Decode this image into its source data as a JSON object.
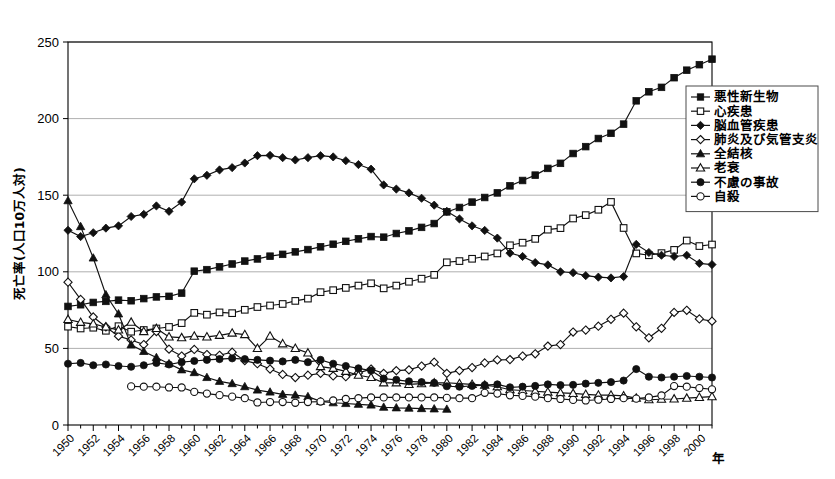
{
  "chart_data": {
    "type": "line",
    "title": "",
    "xlabel": "年",
    "ylabel": "死亡率(人口10万人対)",
    "ylim": [
      0,
      250
    ],
    "yticks": [
      0,
      50,
      100,
      150,
      200,
      250
    ],
    "xlim": [
      1950,
      2001
    ],
    "grid": "horizontal",
    "legend_position": "right-top",
    "x": [
      1950,
      1951,
      1952,
      1953,
      1954,
      1955,
      1956,
      1957,
      1958,
      1959,
      1960,
      1961,
      1962,
      1963,
      1964,
      1965,
      1966,
      1967,
      1968,
      1969,
      1970,
      1971,
      1972,
      1973,
      1974,
      1975,
      1976,
      1977,
      1978,
      1979,
      1980,
      1981,
      1982,
      1983,
      1984,
      1985,
      1986,
      1987,
      1988,
      1989,
      1990,
      1991,
      1992,
      1993,
      1994,
      1995,
      1996,
      1997,
      1998,
      1999,
      2000,
      2001
    ],
    "xtick_labels": [
      "1950",
      "1952",
      "1954",
      "1956",
      "1958",
      "1960",
      "1962",
      "1964",
      "1966",
      "1968",
      "1970",
      "1972",
      "1974",
      "1976",
      "1978",
      "1980",
      "1982",
      "1984",
      "1986",
      "1988",
      "1990",
      "1992",
      "1994",
      "1996",
      "1998",
      "2000"
    ],
    "series": [
      {
        "name": "悪性新生物",
        "marker": "filled-square",
        "values": [
          77.4,
          78.5,
          80.0,
          80.7,
          81.5,
          81.1,
          82.5,
          83.6,
          84.0,
          86.1,
          100.4,
          101.4,
          103.2,
          105.1,
          107.0,
          108.4,
          110.2,
          111.4,
          113.0,
          114.5,
          116.3,
          118.0,
          119.9,
          121.5,
          123.0,
          122.6,
          125.0,
          126.7,
          129.0,
          131.5,
          139.1,
          142.0,
          145.5,
          148.5,
          151.5,
          156.1,
          159.6,
          163.1,
          167.5,
          170.8,
          177.2,
          181.7,
          187.0,
          190.4,
          196.4,
          211.6,
          217.5,
          220.4,
          226.7,
          231.6,
          235.2,
          238.8
        ]
      },
      {
        "name": "心疾患",
        "marker": "open-square",
        "values": [
          64.2,
          63.0,
          63.5,
          61.5,
          64.5,
          60.9,
          62.0,
          63.0,
          64.0,
          66.5,
          73.2,
          72.0,
          73.5,
          73.0,
          75.2,
          77.0,
          78.0,
          79.0,
          81.0,
          82.5,
          86.7,
          88.0,
          89.5,
          91.0,
          92.5,
          89.2,
          91.0,
          93.5,
          95.5,
          98.0,
          106.2,
          107.0,
          108.5,
          110.0,
          112.0,
          117.3,
          119.0,
          121.5,
          127.5,
          128.5,
          134.8,
          137.0,
          140.5,
          145.6,
          128.6,
          112.0,
          110.8,
          112.2,
          114.3,
          120.4,
          116.8,
          117.8
        ]
      },
      {
        "name": "脳血管疾患",
        "marker": "filled-diamond",
        "values": [
          127.1,
          123.0,
          125.5,
          128.5,
          130.0,
          136.1,
          137.5,
          143.0,
          139.5,
          145.5,
          160.7,
          163.0,
          166.5,
          168.0,
          171.0,
          175.8,
          176.0,
          174.5,
          173.0,
          174.5,
          175.8,
          175.0,
          172.5,
          170.0,
          167.0,
          156.7,
          154.0,
          151.5,
          148.0,
          143.5,
          139.5,
          134.5,
          130.0,
          127.0,
          122.0,
          112.2,
          110.0,
          106.0,
          104.5,
          100.0,
          99.4,
          97.5,
          96.5,
          96.0,
          96.9,
          117.9,
          112.6,
          110.8,
          110.0,
          110.8,
          105.5,
          104.7
        ]
      },
      {
        "name": "肺炎及び気管支炎",
        "marker": "open-diamond",
        "values": [
          93.2,
          82.0,
          70.5,
          64.0,
          58.0,
          55.5,
          52.5,
          61.0,
          49.5,
          45.0,
          49.3,
          46.0,
          45.5,
          47.5,
          42.0,
          40.0,
          36.5,
          33.0,
          31.0,
          32.5,
          33.7,
          32.0,
          31.5,
          34.0,
          36.5,
          33.7,
          35.5,
          36.0,
          38.5,
          41.0,
          33.7,
          35.5,
          37.5,
          40.5,
          42.5,
          42.7,
          45.0,
          46.5,
          51.5,
          52.5,
          60.7,
          62.0,
          64.5,
          69.0,
          73.0,
          64.1,
          56.9,
          63.1,
          73.5,
          74.9,
          69.2,
          67.8
        ]
      },
      {
        "name": "全結核",
        "marker": "filled-triangle",
        "values": [
          146.4,
          129.5,
          109.0,
          85.0,
          72.5,
          52.3,
          48.0,
          44.0,
          40.0,
          36.0,
          34.2,
          31.0,
          28.5,
          27.0,
          25.0,
          22.8,
          21.5,
          20.0,
          19.5,
          18.5,
          15.4,
          14.5,
          14.0,
          13.5,
          13.0,
          11.6,
          11.2,
          11.0,
          10.7,
          10.5,
          10.3,
          null,
          null,
          null,
          null,
          null,
          null,
          null,
          null,
          null,
          null,
          null,
          null,
          null,
          null,
          null,
          null,
          null,
          null,
          null,
          null,
          null
        ]
      },
      {
        "name": "老衰",
        "marker": "open-triangle",
        "values": [
          68.9,
          67.0,
          66.0,
          64.0,
          62.0,
          67.1,
          61.0,
          63.0,
          57.5,
          57.0,
          58.0,
          57.5,
          58.5,
          60.0,
          59.0,
          50.0,
          58.0,
          53.0,
          50.0,
          47.0,
          38.1,
          37.0,
          35.0,
          32.5,
          31.0,
          27.5,
          27.5,
          26.5,
          27.0,
          27.5,
          27.6,
          27.0,
          26.5,
          26.0,
          25.0,
          23.0,
          22.5,
          22.0,
          21.5,
          21.0,
          20.6,
          20.0,
          19.5,
          19.5,
          19.0,
          17.5,
          16.5,
          16.8,
          17.0,
          17.5,
          18.0,
          18.5
        ]
      },
      {
        "name": "不慮の事故",
        "marker": "filled-circle",
        "values": [
          40.0,
          40.5,
          39.0,
          39.5,
          38.5,
          38.0,
          39.0,
          40.5,
          39.5,
          41.0,
          41.8,
          42.5,
          43.0,
          43.5,
          43.0,
          42.5,
          42.0,
          41.5,
          42.5,
          41.0,
          42.5,
          40.0,
          38.5,
          37.0,
          35.5,
          30.3,
          29.5,
          28.5,
          28.0,
          27.5,
          25.3,
          25.0,
          25.5,
          26.0,
          26.5,
          24.6,
          25.0,
          25.5,
          26.5,
          26.0,
          26.2,
          27.0,
          27.5,
          28.0,
          29.0,
          36.5,
          31.5,
          31.0,
          31.5,
          32.0,
          31.5,
          31.0
        ]
      },
      {
        "name": "自殺",
        "marker": "open-circle",
        "values": [
          null,
          null,
          null,
          null,
          null,
          25.2,
          25.0,
          25.0,
          24.5,
          24.5,
          21.6,
          20.5,
          19.5,
          18.5,
          17.5,
          14.7,
          15.0,
          15.0,
          14.5,
          15.0,
          15.3,
          16.0,
          17.0,
          17.5,
          18.0,
          18.0,
          18.0,
          18.0,
          18.0,
          18.0,
          17.7,
          17.5,
          17.5,
          21.0,
          20.5,
          19.4,
          19.0,
          18.5,
          17.5,
          17.0,
          16.4,
          16.0,
          16.5,
          17.0,
          17.5,
          17.2,
          18.0,
          19.3,
          25.4,
          25.0,
          24.1,
          23.3
        ]
      }
    ]
  },
  "legend": {
    "items": [
      {
        "label": "悪性新生物",
        "marker": "filled-square"
      },
      {
        "label": "心疾患",
        "marker": "open-square"
      },
      {
        "label": "脳血管疾患",
        "marker": "filled-diamond"
      },
      {
        "label": "肺炎及び気管支炎",
        "marker": "open-diamond"
      },
      {
        "label": "全結核",
        "marker": "filled-triangle"
      },
      {
        "label": "老衰",
        "marker": "open-triangle"
      },
      {
        "label": "不慮の事故",
        "marker": "filled-circle"
      },
      {
        "label": "自殺",
        "marker": "open-circle"
      }
    ]
  },
  "axes": {
    "y_title": "死亡率(人口10万人対)",
    "x_title": "年"
  }
}
